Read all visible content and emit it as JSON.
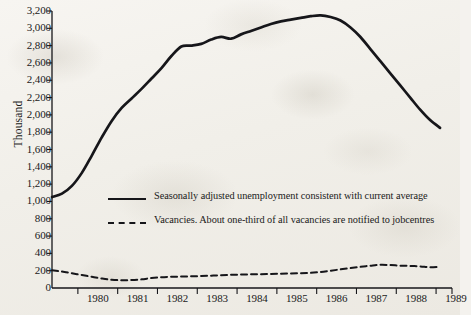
{
  "figure": {
    "ylabel": "Thousand",
    "y_ticks": [
      "0",
      "200",
      "400",
      "600",
      "800",
      "1,000",
      "1,200",
      "1,400",
      "1,600",
      "1,800",
      "2,000",
      "2,200",
      "2,400",
      "2,600",
      "2,800",
      "3,000",
      "3,200"
    ],
    "x_ticks": [
      "1980",
      "1981",
      "1982",
      "1983",
      "1984",
      "1985",
      "1986",
      "1987",
      "1988",
      "1989"
    ],
    "legend": [
      {
        "key": "solid-line-key",
        "label": "Seasonally adjusted unemployment consistent with current average"
      },
      {
        "key": "dashed-line-key",
        "label": "Vacancies. About one-third of all vacancies are notified to jobcentres"
      }
    ],
    "ink_color": "#16161a",
    "paper_color": "#f4f2ee"
  },
  "chart_data": {
    "type": "line",
    "title": "",
    "xlabel": "",
    "ylabel": "Thousand",
    "xlim": [
      1979.35,
      1989.4
    ],
    "ylim": [
      0,
      3200
    ],
    "grid": false,
    "legend_position": "center",
    "x_tick_values": [
      1980,
      1981,
      1982,
      1983,
      1984,
      1985,
      1986,
      1987,
      1988,
      1989
    ],
    "y_tick_values": [
      0,
      200,
      400,
      600,
      800,
      1000,
      1200,
      1400,
      1600,
      1800,
      2000,
      2200,
      2400,
      2600,
      2800,
      3000,
      3200
    ],
    "series": [
      {
        "name": "Seasonally adjusted unemployment consistent with current average",
        "style": "solid",
        "x": [
          1979.35,
          1979.6,
          1979.85,
          1980.1,
          1980.35,
          1980.6,
          1980.85,
          1981.1,
          1981.35,
          1981.6,
          1981.85,
          1982.1,
          1982.35,
          1982.6,
          1982.85,
          1983.1,
          1983.35,
          1983.6,
          1983.85,
          1984.1,
          1984.35,
          1984.6,
          1984.85,
          1985.1,
          1985.35,
          1985.6,
          1985.85,
          1986.1,
          1986.35,
          1986.6,
          1986.85,
          1987.1,
          1987.35,
          1987.6,
          1987.85,
          1988.1,
          1988.35,
          1988.6,
          1988.85,
          1989.1
        ],
        "y": [
          1050,
          1090,
          1180,
          1330,
          1530,
          1740,
          1930,
          2080,
          2190,
          2300,
          2420,
          2540,
          2680,
          2790,
          2800,
          2820,
          2870,
          2900,
          2880,
          2930,
          2970,
          3010,
          3050,
          3080,
          3100,
          3120,
          3140,
          3150,
          3130,
          3090,
          3010,
          2900,
          2760,
          2620,
          2480,
          2340,
          2200,
          2060,
          1940,
          1850
        ]
      },
      {
        "name": "Vacancies. About one-third of all vacancies are notified to jobcentres",
        "style": "dashed",
        "x": [
          1979.35,
          1979.6,
          1979.85,
          1980.1,
          1980.35,
          1980.6,
          1980.85,
          1981.1,
          1981.35,
          1981.6,
          1981.85,
          1982.1,
          1982.35,
          1982.6,
          1982.85,
          1983.1,
          1983.35,
          1983.6,
          1983.85,
          1984.1,
          1984.35,
          1984.6,
          1984.85,
          1985.1,
          1985.35,
          1985.6,
          1985.85,
          1986.1,
          1986.35,
          1986.6,
          1986.85,
          1987.1,
          1987.35,
          1987.6,
          1987.85,
          1988.1,
          1988.35,
          1988.6,
          1988.85,
          1989.1
        ],
        "y": [
          205,
          190,
          170,
          150,
          130,
          110,
          95,
          90,
          92,
          100,
          115,
          125,
          130,
          132,
          135,
          138,
          142,
          148,
          152,
          155,
          158,
          160,
          162,
          165,
          168,
          170,
          175,
          185,
          200,
          215,
          230,
          245,
          258,
          268,
          265,
          258,
          255,
          250,
          240,
          245
        ]
      }
    ]
  }
}
